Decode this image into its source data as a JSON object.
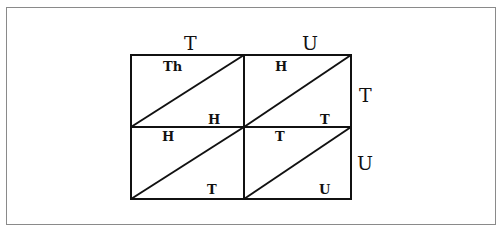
{
  "diagram": {
    "column_headers": [
      "T",
      "U"
    ],
    "row_headers": [
      "T",
      "U"
    ],
    "cells": [
      [
        {
          "top": "Th",
          "bottom": "H"
        },
        {
          "top": "H",
          "bottom": "T"
        }
      ],
      [
        {
          "top": "H",
          "bottom": "T"
        },
        {
          "top": "T",
          "bottom": "U"
        }
      ]
    ],
    "colors": {
      "lines": "#111111",
      "frame": "#8a8a8a",
      "background": "#ffffff"
    }
  }
}
